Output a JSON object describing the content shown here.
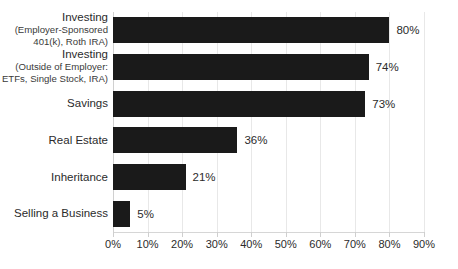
{
  "chart_data": {
    "type": "bar",
    "orientation": "horizontal",
    "title": "",
    "subtitle": "",
    "xlabel": "",
    "ylabel": "",
    "xlim": [
      0,
      90
    ],
    "grid": true,
    "legend": false,
    "value_suffix": "%",
    "bar_color": "#1a1a1a",
    "gridline_color": "#e8e8e8",
    "text_color": "#2b2b2b",
    "categories": [
      "Investing\n(Employer-Sponsored\n401(k), Roth IRA)",
      "Investing\n(Outside of Employer:\nETFs, Single Stock, IRA)",
      "Savings",
      "Real Estate",
      "Inheritance",
      "Selling a Business"
    ],
    "category_lines": [
      {
        "lead": "Investing",
        "sub": "(Employer-Sponsored\n401(k), Roth IRA)"
      },
      {
        "lead": "Investing",
        "sub": "(Outside of Employer:\nETFs, Single Stock, IRA)"
      },
      {
        "lead": "Savings",
        "sub": ""
      },
      {
        "lead": "Real Estate",
        "sub": ""
      },
      {
        "lead": "Inheritance",
        "sub": ""
      },
      {
        "lead": "Selling a Business",
        "sub": ""
      }
    ],
    "values": [
      80,
      74,
      73,
      36,
      21,
      5
    ],
    "data_labels": [
      "80%",
      "74%",
      "73%",
      "36%",
      "21%",
      "5%"
    ],
    "xticks": [
      0,
      10,
      20,
      30,
      40,
      50,
      60,
      70,
      80,
      90
    ],
    "xticklabels": [
      "0%",
      "10%",
      "20%",
      "30%",
      "40%",
      "50%",
      "60%",
      "70%",
      "80%",
      "90%"
    ]
  }
}
